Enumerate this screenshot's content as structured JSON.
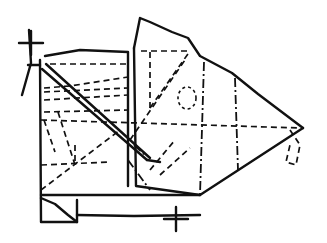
{
  "diagram": {
    "title": "Hand-drawn fold diagram sketch",
    "stroke_color": "#111111",
    "background": "#ffffff",
    "solid_paths": [
      "M40,60 L41,222 L77,222",
      "M45,56 L80,50 L128,52 L128,186",
      "M134,48 L140,18 L150,22 L172,32 L188,38 L200,56 L232,73 L258,94 L303,128",
      "M134,48 L136,186 L200,195 L303,128",
      "M41,195 L200,195",
      "M41,198 L55,204 L68,215 L77,222 L77,200",
      "M77,215 L134,216 L200,215",
      "M42,69 L147,160",
      "M46,64 L150,158",
      "M147,160 L160,162"
    ],
    "dashed_paths": [
      "M50,64 L128,64",
      "M44,88 L70,86 L128,77",
      "M44,92 L128,88",
      "M44,100 L128,95",
      "M44,112 L128,110",
      "M141,51 L190,51",
      "M150,52 L150,108",
      "M150,108 L190,51",
      "M41,120 L300,128",
      "M41,165 L110,162",
      "M44,120 L55,152",
      "M58,112 L75,165",
      "M75,145 L75,165",
      "M41,190 L120,130",
      "M130,140 L185,60",
      "M150,170 L175,140",
      "M160,175 L190,148",
      "M290,130 L300,145 L296,165 L286,162 L290,145"
    ],
    "dashdot_paths": [
      "M204,62 L200,195",
      "M235,78 L238,170",
      "M128,160 L150,190",
      "M134,145 L145,155"
    ],
    "circle": {
      "cx": 187,
      "cy": 98,
      "rx": 9,
      "ry": 11
    },
    "crosses": [
      {
        "x": 31,
        "y": 43,
        "size": 12,
        "label": "registration-mark-top-left"
      },
      {
        "x": 176,
        "y": 219,
        "size": 12,
        "label": "registration-mark-bottom"
      }
    ],
    "left_marker_path": "M29,30 L31,63 L22,95",
    "left_marker_tick": "M28,65 L40,65"
  }
}
